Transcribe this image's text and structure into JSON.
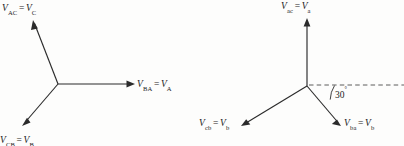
{
  "figure": {
    "type": "phasor-diagram-pair",
    "background_color": "#fdfdfc",
    "line_color": "#2b2b2b",
    "text_color": "#1c1c1c"
  },
  "left_diagram": {
    "name": "line-to-line-voltage-phasors-uppercase",
    "origin": {
      "x": 58,
      "y": 84
    },
    "vectors": [
      {
        "id": "vac",
        "label_plain": "V_AC = V_C",
        "symbol": "V",
        "sub1": "AC",
        "sub2": "C",
        "angle_deg": 120,
        "tip": {
          "x": 33,
          "y": 20
        }
      },
      {
        "id": "vba",
        "label_plain": "V_BA = V_A",
        "symbol": "V",
        "sub1": "BA",
        "sub2": "A",
        "angle_deg": 0,
        "tip": {
          "x": 135,
          "y": 84
        }
      },
      {
        "id": "vcb",
        "label_plain": "V_CB = V_B",
        "symbol": "V",
        "sub1": "CB",
        "sub2": "B",
        "angle_deg": 240,
        "tip": {
          "x": 22,
          "y": 126
        }
      }
    ]
  },
  "right_diagram": {
    "name": "line-to-line-voltage-phasors-lowercase",
    "origin": {
      "x": 307,
      "y": 86
    },
    "vectors": [
      {
        "id": "vac",
        "label_plain": "V_ac = V_a",
        "symbol": "V",
        "sub1": "ac",
        "sub2": "a",
        "angle_deg": 90,
        "tip": {
          "x": 307,
          "y": 18
        }
      },
      {
        "id": "vba",
        "label_plain": "V_ba = V_b",
        "symbol": "V",
        "sub1": "ba",
        "sub2": "b",
        "angle_deg": -30,
        "tip": {
          "x": 341,
          "y": 126
        }
      },
      {
        "id": "vcb",
        "label_plain": "V_cb = V_b",
        "symbol": "V",
        "sub1": "cb",
        "sub2": "b",
        "angle_deg": 210,
        "tip": {
          "x": 241,
          "y": 126
        }
      }
    ],
    "reference_line": {
      "style": "dashed",
      "from": {
        "x": 307,
        "y": 85
      },
      "to": {
        "x": 404,
        "y": 85
      }
    },
    "angle_annotation": {
      "value": "30",
      "unit": "°",
      "between": [
        "reference-line-horizontal",
        "vba"
      ]
    }
  }
}
